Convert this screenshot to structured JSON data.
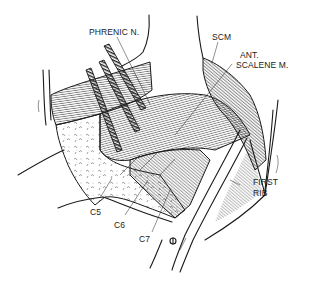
{
  "figure": {
    "type": "anatomical line drawing",
    "labels": {
      "phrenic": "PHRENIC N.",
      "scm": "SCM",
      "ant_line1": "ANT.",
      "ant_line2": "SCALENE M.",
      "first_line1": "FIRST",
      "first_line2": "RIB",
      "c5": "C5",
      "c6": "C6",
      "c7": "C7"
    },
    "colors": {
      "ink": "#1a1a1a",
      "background": "#ffffff"
    }
  }
}
